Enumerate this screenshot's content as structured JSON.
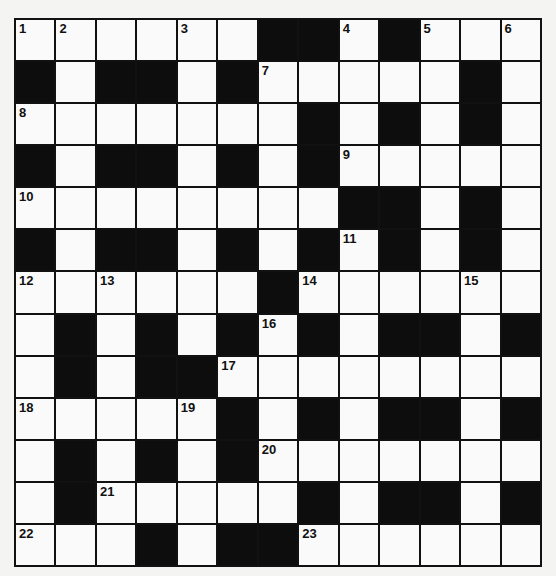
{
  "puzzle": {
    "type": "crossword",
    "size": {
      "rows": 13,
      "cols": 13
    },
    "colors": {
      "black": "#0d0d0d",
      "white": "#fafafa",
      "lines": "#111111"
    },
    "grid": [
      "......##.#...",
      "#.##.#.....#.",
      ".......#.#.#.",
      "#.##.#.#.....",
      "........##.#.",
      "#.##.#.#.#.#.",
      "......#......",
      ".#.#.#.#.##.#",
      ".#.##........",
      ".....#.#.##.#",
      ".#.#.#.......",
      ".#.....#.##.#",
      "...#.##......"
    ],
    "numbers": [
      {
        "n": "1",
        "r": 0,
        "c": 0
      },
      {
        "n": "2",
        "r": 0,
        "c": 1
      },
      {
        "n": "3",
        "r": 0,
        "c": 4
      },
      {
        "n": "4",
        "r": 0,
        "c": 8
      },
      {
        "n": "5",
        "r": 0,
        "c": 10
      },
      {
        "n": "6",
        "r": 0,
        "c": 12
      },
      {
        "n": "7",
        "r": 1,
        "c": 6
      },
      {
        "n": "8",
        "r": 2,
        "c": 0
      },
      {
        "n": "9",
        "r": 3,
        "c": 8
      },
      {
        "n": "10",
        "r": 4,
        "c": 0
      },
      {
        "n": "11",
        "r": 5,
        "c": 8
      },
      {
        "n": "12",
        "r": 6,
        "c": 0
      },
      {
        "n": "13",
        "r": 6,
        "c": 2
      },
      {
        "n": "14",
        "r": 6,
        "c": 7
      },
      {
        "n": "15",
        "r": 6,
        "c": 11
      },
      {
        "n": "16",
        "r": 7,
        "c": 6
      },
      {
        "n": "17",
        "r": 8,
        "c": 5
      },
      {
        "n": "18",
        "r": 9,
        "c": 0
      },
      {
        "n": "19",
        "r": 9,
        "c": 4
      },
      {
        "n": "20",
        "r": 10,
        "c": 6
      },
      {
        "n": "21",
        "r": 11,
        "c": 2
      },
      {
        "n": "22",
        "r": 12,
        "c": 0
      },
      {
        "n": "23",
        "r": 12,
        "c": 7
      }
    ]
  }
}
